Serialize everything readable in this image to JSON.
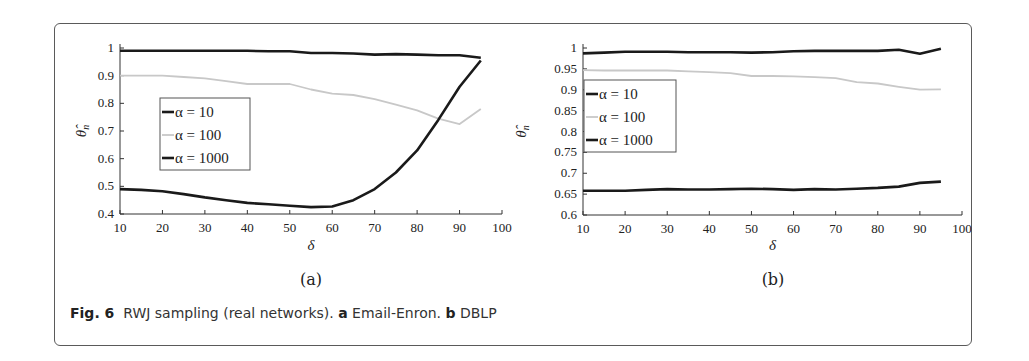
{
  "caption": {
    "fig_label": "Fig. 6",
    "text": "RWJ sampling (real networks).",
    "part_a_letter": "a",
    "part_a_text": "Email-Enron.",
    "part_b_letter": "b",
    "part_b_text": "DBLP"
  },
  "chart_data": [
    {
      "type": "line",
      "panel": "(a)",
      "title": "",
      "xlabel": "δ",
      "ylabel": "θ̂_n",
      "xlim": [
        10,
        100
      ],
      "ylim": [
        0.4,
        1
      ],
      "xticks": [
        10,
        20,
        30,
        40,
        50,
        60,
        70,
        80,
        90,
        100
      ],
      "yticks": [
        0.4,
        0.5,
        0.6,
        0.7,
        0.8,
        0.9,
        1
      ],
      "grid": false,
      "legend_position": "center-left",
      "x": [
        10,
        15,
        20,
        25,
        30,
        35,
        40,
        45,
        50,
        55,
        60,
        65,
        70,
        75,
        80,
        85,
        90,
        95
      ],
      "series": [
        {
          "name": "α = 10",
          "color": "#1a1a1a",
          "values": [
            0.99,
            0.99,
            0.99,
            0.99,
            0.99,
            0.99,
            0.99,
            0.988,
            0.988,
            0.982,
            0.982,
            0.98,
            0.976,
            0.978,
            0.976,
            0.974,
            0.974,
            0.965
          ]
        },
        {
          "name": "α = 100",
          "color": "#c8c8c8",
          "values": [
            0.9,
            0.9,
            0.9,
            0.895,
            0.89,
            0.88,
            0.87,
            0.87,
            0.87,
            0.85,
            0.835,
            0.83,
            0.815,
            0.795,
            0.775,
            0.745,
            0.725,
            0.78
          ]
        },
        {
          "name": "α = 1000",
          "color": "#1a1a1a",
          "values": [
            0.49,
            0.487,
            0.482,
            0.472,
            0.46,
            0.45,
            0.44,
            0.435,
            0.43,
            0.425,
            0.427,
            0.45,
            0.49,
            0.55,
            0.63,
            0.74,
            0.86,
            0.955
          ]
        }
      ]
    },
    {
      "type": "line",
      "panel": "(b)",
      "title": "",
      "xlabel": "δ",
      "ylabel": "θ̂_n",
      "xlim": [
        10,
        100
      ],
      "ylim": [
        0.6,
        1
      ],
      "xticks": [
        10,
        20,
        30,
        40,
        50,
        60,
        70,
        80,
        90,
        100
      ],
      "yticks": [
        0.6,
        0.65,
        0.7,
        0.75,
        0.8,
        0.85,
        0.9,
        0.95,
        1
      ],
      "grid": false,
      "legend_position": "center-left",
      "x": [
        10,
        15,
        20,
        25,
        30,
        35,
        40,
        45,
        50,
        55,
        60,
        65,
        70,
        75,
        80,
        85,
        90,
        95
      ],
      "series": [
        {
          "name": "α = 10",
          "color": "#1a1a1a",
          "values": [
            0.987,
            0.989,
            0.991,
            0.991,
            0.991,
            0.99,
            0.99,
            0.99,
            0.989,
            0.99,
            0.992,
            0.993,
            0.993,
            0.993,
            0.993,
            0.996,
            0.986,
            0.998
          ]
        },
        {
          "name": "α = 100",
          "color": "#c8c8c8",
          "values": [
            0.947,
            0.946,
            0.946,
            0.946,
            0.946,
            0.944,
            0.942,
            0.94,
            0.933,
            0.933,
            0.932,
            0.93,
            0.928,
            0.918,
            0.915,
            0.907,
            0.9,
            0.901
          ]
        },
        {
          "name": "α = 1000",
          "color": "#1a1a1a",
          "values": [
            0.658,
            0.658,
            0.658,
            0.66,
            0.662,
            0.661,
            0.661,
            0.662,
            0.663,
            0.662,
            0.66,
            0.662,
            0.661,
            0.663,
            0.665,
            0.668,
            0.677,
            0.68
          ]
        }
      ]
    }
  ]
}
